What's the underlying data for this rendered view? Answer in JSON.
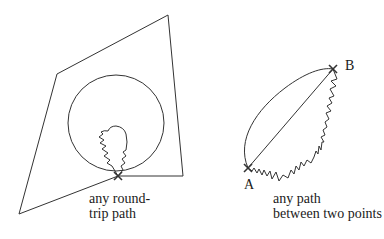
{
  "left_figure": {
    "caption_line1": "any round-",
    "caption_line2": "trip path"
  },
  "right_figure": {
    "point_a": "A",
    "point_b": "B",
    "caption_line1": "any path",
    "caption_line2": "between two points"
  },
  "colors": {
    "stroke": "#333333",
    "text": "#1a1a1a",
    "background": "#ffffff"
  }
}
